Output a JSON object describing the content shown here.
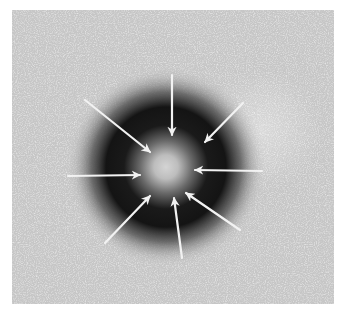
{
  "image": {
    "description": "Grayscale micrograph-style image: noisy gray field with a dark circular halo surrounding a bright center, eight white arrows pointing inward toward the center",
    "colors": {
      "background": "#ffffff",
      "field": "#c8c8c8",
      "field_noise_light": "#e6e6e6",
      "ring_dark": "#141414",
      "center_bright": "#d0d0d0",
      "arrow": "#f2f2f2"
    },
    "halo": {
      "center": [
        154,
        157
      ],
      "inner_radius": 22,
      "dark_peak_radius": 55,
      "outer_radius": 95
    },
    "arrows": [
      {
        "name": "arrow-top",
        "x1": 160,
        "y1": 65,
        "x2": 160,
        "y2": 125
      },
      {
        "name": "arrow-top-left",
        "x1": 73,
        "y1": 90,
        "x2": 138,
        "y2": 142
      },
      {
        "name": "arrow-top-right",
        "x1": 231,
        "y1": 93,
        "x2": 193,
        "y2": 132
      },
      {
        "name": "arrow-left",
        "x1": 56,
        "y1": 166,
        "x2": 128,
        "y2": 165
      },
      {
        "name": "arrow-right",
        "x1": 250,
        "y1": 161,
        "x2": 183,
        "y2": 160
      },
      {
        "name": "arrow-bottom-left",
        "x1": 93,
        "y1": 233,
        "x2": 138,
        "y2": 186
      },
      {
        "name": "arrow-bottom",
        "x1": 170,
        "y1": 248,
        "x2": 162,
        "y2": 188
      },
      {
        "name": "arrow-bottom-right",
        "x1": 228,
        "y1": 220,
        "x2": 174,
        "y2": 183
      }
    ]
  }
}
